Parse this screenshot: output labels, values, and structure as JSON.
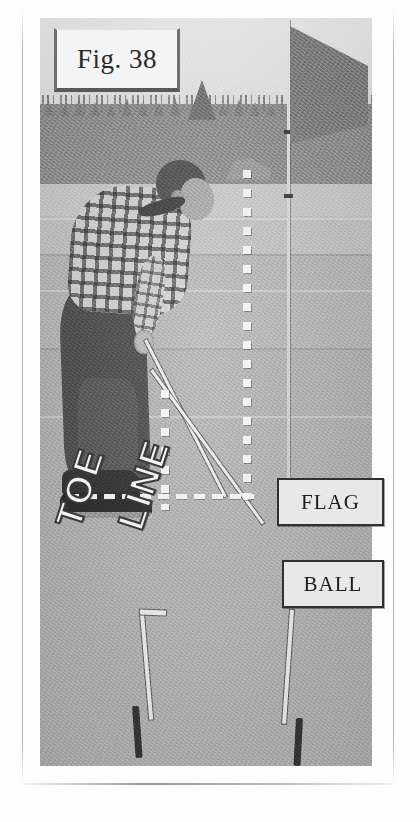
{
  "page": {
    "type": "scanned-book-page",
    "background_color": "#fdfdfd"
  },
  "figure": {
    "caption": "Fig. 38",
    "caption_box": {
      "x": 54,
      "y": 28,
      "width": 120,
      "height": 58
    },
    "photo": {
      "x": 40,
      "y": 18,
      "width": 332,
      "height": 748,
      "style": "black-and-white halftone photograph",
      "scene": "A golfer bends over a putt on a green; two alignment sticks lie on the ground forming a right angle toward the flagstick."
    }
  },
  "overlay_labels": [
    {
      "text": "FLAG",
      "x": 277,
      "y": 478,
      "width": 103,
      "height": 44
    },
    {
      "text": "BALL",
      "x": 282,
      "y": 560,
      "width": 98,
      "height": 44
    }
  ],
  "word_art": [
    {
      "text": "TOE",
      "rotation_deg": -72
    },
    {
      "text": "LINE",
      "rotation_deg": -72
    }
  ],
  "annotation_lines": {
    "vertical_dotted_left": {
      "x": 163,
      "y": 392,
      "length": 110
    },
    "vertical_dotted_right": {
      "x": 247,
      "y": 172,
      "length": 320
    },
    "horizontal_dashed": {
      "x": 70,
      "y": 497,
      "length": 193
    }
  },
  "colors": {
    "photo_green": "#b5b5b5",
    "sky": "#eaeaea",
    "treeline": "#8c8c8c",
    "label_fill": "#e8e8e8",
    "label_border": "#303030",
    "flag": "#7c7c7c",
    "page": "#fdfdfd"
  }
}
